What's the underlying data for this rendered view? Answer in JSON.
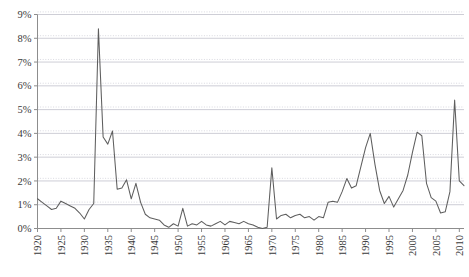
{
  "chart_data": {
    "type": "line",
    "title": "",
    "subtitle": "",
    "xlabel": "",
    "ylabel": "",
    "xlim": [
      1920,
      2011
    ],
    "ylim": [
      0,
      9
    ],
    "grid": true,
    "legend_position": "none",
    "y_tick_labels": [
      "0%",
      "1%",
      "2%",
      "3%",
      "4%",
      "5%",
      "6%",
      "7%",
      "8%",
      "9%"
    ],
    "y_tick_values": [
      0,
      1,
      2,
      3,
      4,
      5,
      6,
      7,
      8,
      9
    ],
    "x_tick_labels": [
      "1920",
      "1925",
      "1930",
      "1935",
      "1940",
      "1945",
      "1950",
      "1955",
      "1960",
      "1965",
      "1970",
      "1975",
      "1980",
      "1985",
      "1990",
      "1995",
      "2000",
      "2005",
      "2010"
    ],
    "x_tick_values": [
      1920,
      1925,
      1930,
      1935,
      1940,
      1945,
      1950,
      1955,
      1960,
      1965,
      1970,
      1975,
      1980,
      1985,
      1990,
      1995,
      2000,
      2005,
      2010
    ],
    "series": [
      {
        "name": "annual-rate",
        "color": "#5e5e5e",
        "x": [
          1920,
          1921,
          1922,
          1923,
          1924,
          1925,
          1926,
          1927,
          1928,
          1929,
          1930,
          1931,
          1932,
          1933,
          1934,
          1935,
          1936,
          1937,
          1938,
          1939,
          1940,
          1941,
          1942,
          1943,
          1944,
          1945,
          1946,
          1947,
          1948,
          1949,
          1950,
          1951,
          1952,
          1953,
          1954,
          1955,
          1956,
          1957,
          1958,
          1959,
          1960,
          1961,
          1962,
          1963,
          1964,
          1965,
          1966,
          1967,
          1968,
          1969,
          1970,
          1971,
          1972,
          1973,
          1974,
          1975,
          1976,
          1977,
          1978,
          1979,
          1980,
          1981,
          1982,
          1983,
          1984,
          1985,
          1986,
          1987,
          1988,
          1989,
          1990,
          1991,
          1992,
          1993,
          1994,
          1995,
          1996,
          1997,
          1998,
          1999,
          2000,
          2001,
          2002,
          2003,
          2004,
          2005,
          2006,
          2007,
          2008,
          2009,
          2010,
          2011
        ],
        "values": [
          1.25,
          1.1,
          0.95,
          0.8,
          0.85,
          1.15,
          1.05,
          0.95,
          0.85,
          0.65,
          0.4,
          0.8,
          1.05,
          8.4,
          3.85,
          3.55,
          4.1,
          1.65,
          1.7,
          2.05,
          1.25,
          1.9,
          1.1,
          0.6,
          0.45,
          0.4,
          0.35,
          0.15,
          0.05,
          0.2,
          0.1,
          0.85,
          0.1,
          0.2,
          0.15,
          0.3,
          0.15,
          0.1,
          0.2,
          0.3,
          0.15,
          0.3,
          0.25,
          0.2,
          0.3,
          0.2,
          0.15,
          0.05,
          0.0,
          0.05,
          2.55,
          0.4,
          0.55,
          0.6,
          0.45,
          0.55,
          0.6,
          0.45,
          0.5,
          0.35,
          0.5,
          0.45,
          1.1,
          1.15,
          1.1,
          1.55,
          2.1,
          1.7,
          1.8,
          2.6,
          3.4,
          4.0,
          2.7,
          1.6,
          1.05,
          1.35,
          0.9,
          1.25,
          1.6,
          2.25,
          3.2,
          4.05,
          3.9,
          1.9,
          1.3,
          1.15,
          0.65,
          0.7,
          1.55,
          5.4,
          2.0,
          1.8
        ]
      }
    ]
  },
  "axes": {
    "y_axis_name": "percent-axis",
    "x_axis_name": "year-axis"
  }
}
